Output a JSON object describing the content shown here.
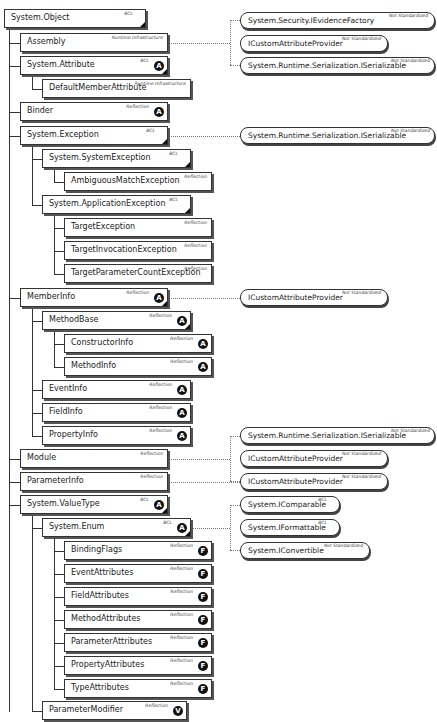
{
  "diagram": {
    "type": "class-hierarchy",
    "classes": [
      {
        "name": "System.Object",
        "tag": "BCL",
        "badge": "",
        "corner": true
      },
      {
        "name": "Assembly",
        "tag": "Runtime Infrastructure",
        "badge": "",
        "corner": false
      },
      {
        "name": "System.Attribute",
        "tag": "BCL",
        "badge": "A",
        "corner": true
      },
      {
        "name": "DefaultMemberAttribute",
        "tag": "Runtime Infrastructure",
        "badge": "",
        "corner": false
      },
      {
        "name": "Binder",
        "tag": "Reflection",
        "badge": "A",
        "corner": false
      },
      {
        "name": "System.Exception",
        "tag": "BCL",
        "badge": "",
        "corner": true
      },
      {
        "name": "System.SystemException",
        "tag": "BCL",
        "badge": "",
        "corner": true
      },
      {
        "name": "AmbiguousMatchException",
        "tag": "Reflection",
        "badge": "",
        "corner": false
      },
      {
        "name": "System.ApplicationException",
        "tag": "BCL",
        "badge": "",
        "corner": true
      },
      {
        "name": "TargetException",
        "tag": "Reflection",
        "badge": "",
        "corner": false
      },
      {
        "name": "TargetInvocationException",
        "tag": "Reflection",
        "badge": "",
        "corner": false
      },
      {
        "name": "TargetParameterCountException",
        "tag": "Reflection",
        "badge": "",
        "corner": false
      },
      {
        "name": "MemberInfo",
        "tag": "Reflection",
        "badge": "A",
        "corner": true
      },
      {
        "name": "MethodBase",
        "tag": "Reflection",
        "badge": "A",
        "corner": true
      },
      {
        "name": "ConstructorInfo",
        "tag": "Reflection",
        "badge": "A",
        "corner": false
      },
      {
        "name": "MethodInfo",
        "tag": "Reflection",
        "badge": "A",
        "corner": false
      },
      {
        "name": "EventInfo",
        "tag": "Reflection",
        "badge": "A",
        "corner": false
      },
      {
        "name": "FieldInfo",
        "tag": "Reflection",
        "badge": "A",
        "corner": false
      },
      {
        "name": "PropertyInfo",
        "tag": "Reflection",
        "badge": "A",
        "corner": false
      },
      {
        "name": "Module",
        "tag": "Reflection",
        "badge": "",
        "corner": false
      },
      {
        "name": "ParameterInfo",
        "tag": "Reflection",
        "badge": "",
        "corner": false
      },
      {
        "name": "System.ValueType",
        "tag": "BCL",
        "badge": "A",
        "corner": true
      },
      {
        "name": "System.Enum",
        "tag": "BCL",
        "badge": "A",
        "corner": true
      },
      {
        "name": "BindingFlags",
        "tag": "Reflection",
        "badge": "F",
        "corner": false
      },
      {
        "name": "EventAttributes",
        "tag": "Reflection",
        "badge": "F",
        "corner": false
      },
      {
        "name": "FieldAttributes",
        "tag": "Reflection",
        "badge": "F",
        "corner": false
      },
      {
        "name": "MethodAttributes",
        "tag": "Reflection",
        "badge": "F",
        "corner": false
      },
      {
        "name": "ParameterAttributes",
        "tag": "Reflection",
        "badge": "F",
        "corner": false
      },
      {
        "name": "PropertyAttributes",
        "tag": "Reflection",
        "badge": "F",
        "corner": false
      },
      {
        "name": "TypeAttributes",
        "tag": "Reflection",
        "badge": "F",
        "corner": false
      },
      {
        "name": "ParameterModifier",
        "tag": "Reflection",
        "badge": "V",
        "corner": false
      }
    ],
    "interfaces": [
      {
        "name": "System.Security.IEvidenceFactory",
        "tag": "Not Standardized"
      },
      {
        "name": "ICustomAttributeProvider",
        "tag": "Not Standardized"
      },
      {
        "name": "System.Runtime.Serialization.ISerializable",
        "tag": "Not Standardized"
      },
      {
        "name": "System.Runtime.Serialization.ISerializable",
        "tag": "Not Standardized"
      },
      {
        "name": "ICustomAttributeProvider",
        "tag": "Not Standardized"
      },
      {
        "name": "System.Runtime.Serialization.ISerializable",
        "tag": "Not Standardized"
      },
      {
        "name": "ICustomAttributeProvider",
        "tag": "Not Standardized"
      },
      {
        "name": "ICustomAttributeProvider",
        "tag": "Not Standardized"
      },
      {
        "name": "System.IComparable",
        "tag": "BCL"
      },
      {
        "name": "System.IFormattable",
        "tag": "BCL"
      },
      {
        "name": "System.IConvertible",
        "tag": "Not Standardized"
      }
    ]
  }
}
